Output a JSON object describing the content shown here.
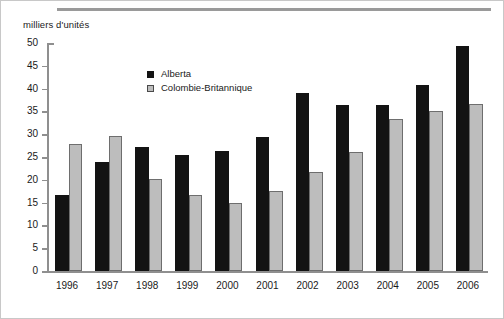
{
  "figure": {
    "y_axis_title": "milliers d'unités"
  },
  "legend": {
    "position": "inside-top-center",
    "entries": [
      {
        "label": "Alberta",
        "color": "#131313",
        "marker": "filled-square-icon"
      },
      {
        "label": "Colombie-Britannique",
        "color": "#bdbdbd",
        "marker": "outlined-square-icon"
      }
    ]
  },
  "chart_data": {
    "type": "bar",
    "title": "",
    "subtitle": "",
    "xlabel": "",
    "ylabel": "milliers d'unités",
    "ylim": [
      0,
      50
    ],
    "ytick_labels": [
      "0",
      "5",
      "10",
      "15",
      "20",
      "25",
      "30",
      "35",
      "40",
      "45",
      "50"
    ],
    "ytick_values": [
      0,
      5,
      10,
      15,
      20,
      25,
      30,
      35,
      40,
      45,
      50
    ],
    "grid": false,
    "legend_position": "inside-top-center",
    "categories": [
      "1996",
      "1997",
      "1998",
      "1999",
      "2000",
      "2001",
      "2002",
      "2003",
      "2004",
      "2005",
      "2006"
    ],
    "series": [
      {
        "name": "Alberta",
        "color": "#131313",
        "values": [
          16.7,
          23.8,
          27.2,
          25.5,
          26.3,
          29.4,
          39.0,
          36.3,
          36.5,
          40.8,
          49.4
        ]
      },
      {
        "name": "Colombie-Britannique",
        "color": "#bdbdbd",
        "values": [
          27.8,
          29.5,
          20.1,
          16.6,
          15.0,
          17.5,
          21.7,
          26.2,
          33.3,
          35.0,
          36.7
        ]
      }
    ]
  }
}
